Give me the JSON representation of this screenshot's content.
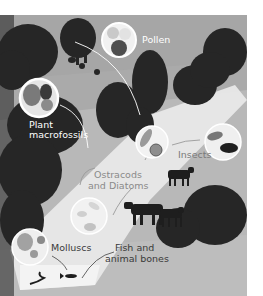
{
  "figure": {
    "type": "illustrated landscape diagram of sediment proxies",
    "palette": {
      "sky": "#a9a9a9",
      "ground": "#b9b9b9",
      "light_beam": "#e6e6e6",
      "tree": "#2a2a2a",
      "circle_fill": "#f2f2f2",
      "circle_stroke": "#ffffff",
      "animal": "#1e1e1e"
    },
    "labels": {
      "pollen": "Pollen",
      "plant_line1": "Plant",
      "plant_line2": "macrofossils",
      "insects": "Insects",
      "ostracods_line1": "Ostracods",
      "ostracods_line2": "and Diatoms",
      "molluscs": "Molluscs",
      "fish_line1": "Fish and",
      "fish_line2": "animal bones"
    },
    "callouts": [
      {
        "id": "pollen",
        "icon": "pollen-grains-icon"
      },
      {
        "id": "plant",
        "icon": "leaf-fragments-icon"
      },
      {
        "id": "insects",
        "icon": "beetle-icon"
      },
      {
        "id": "ostracods",
        "icon": "microfossil-icon"
      },
      {
        "id": "molluscs",
        "icon": "shell-fragments-icon"
      },
      {
        "id": "core",
        "icon": "seed-and-grain-icon"
      }
    ]
  }
}
